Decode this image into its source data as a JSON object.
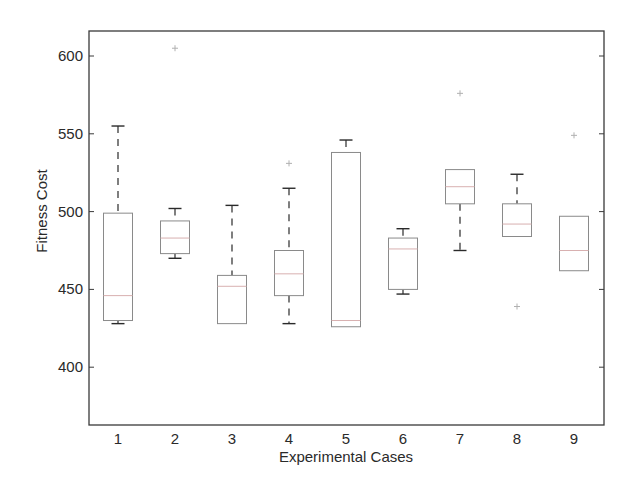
{
  "chart_data": {
    "type": "boxplot",
    "title": "",
    "xlabel": "Experimental Cases",
    "ylabel": "Fitness Cost",
    "ylim": [
      360,
      620
    ],
    "yticks": [
      400,
      450,
      500,
      550,
      600
    ],
    "categories": [
      "1",
      "2",
      "3",
      "4",
      "5",
      "6",
      "7",
      "8",
      "9"
    ],
    "grid": false,
    "legend": null,
    "boxes": [
      {
        "case": "1",
        "whisker_low": 428,
        "q1": 430,
        "median": 446,
        "q3": 499,
        "whisker_high": 555,
        "outliers": []
      },
      {
        "case": "2",
        "whisker_low": 470,
        "q1": 473,
        "median": 483,
        "q3": 494,
        "whisker_high": 502,
        "outliers": [
          605
        ]
      },
      {
        "case": "3",
        "whisker_low": 428,
        "q1": 428,
        "median": 452,
        "q3": 459,
        "whisker_high": 504,
        "outliers": []
      },
      {
        "case": "4",
        "whisker_low": 428,
        "q1": 446,
        "median": 460,
        "q3": 475,
        "whisker_high": 515,
        "outliers": [
          531
        ]
      },
      {
        "case": "5",
        "whisker_low": 426,
        "q1": 426,
        "median": 430,
        "q3": 538,
        "whisker_high": 546,
        "outliers": []
      },
      {
        "case": "6",
        "whisker_low": 447,
        "q1": 450,
        "median": 476,
        "q3": 483,
        "whisker_high": 489,
        "outliers": []
      },
      {
        "case": "7",
        "whisker_low": 475,
        "q1": 505,
        "median": 516,
        "q3": 527,
        "whisker_high": 527,
        "outliers": [
          576
        ]
      },
      {
        "case": "8",
        "whisker_low": 484,
        "q1": 484,
        "median": 492,
        "q3": 505,
        "whisker_high": 524,
        "outliers": [
          439
        ]
      },
      {
        "case": "9",
        "whisker_low": 462,
        "q1": 462,
        "median": 475,
        "q3": 497,
        "whisker_high": 497,
        "outliers": [
          549
        ]
      }
    ]
  },
  "colors": {
    "axis": "#3a3a3a",
    "box": "#8a8a8a",
    "whisker": "#2a2a2a",
    "median": "#d8b0b0",
    "outlier": "#b0b0b0"
  },
  "layout": {
    "plot_left": 89,
    "plot_right": 604,
    "plot_top": 31,
    "plot_bottom": 425,
    "y_px_at_600": 56,
    "y_px_per_unit": 1.556,
    "x_first_center": 118,
    "x_spacing": 57,
    "box_half_width": 14.5,
    "cap_half_width": 6.5
  }
}
